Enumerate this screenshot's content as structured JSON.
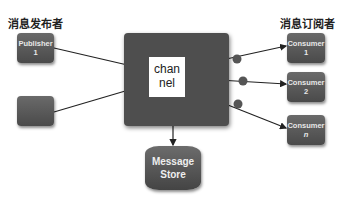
{
  "labels": {
    "publishers_heading": "消息发布者",
    "subscribers_heading": "消息订阅者"
  },
  "publishers": [
    {
      "line1": "Publisher",
      "line2": "1"
    },
    {
      "line1": "",
      "line2": ""
    }
  ],
  "channel": {
    "line1": "chan",
    "line2": "nel"
  },
  "consumers": [
    {
      "line1": "Consumer",
      "line2": "1"
    },
    {
      "line1": "Consumer",
      "line2": "2"
    },
    {
      "line1": "Consumer",
      "line2": "n"
    }
  ],
  "store": {
    "line1": "Message",
    "line2": "Store"
  }
}
